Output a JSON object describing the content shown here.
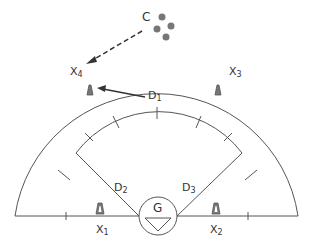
{
  "diagram": {
    "title": "",
    "colors": {
      "line": "#555555",
      "cone": "#777777",
      "ball": "#777777",
      "text": "#333333"
    },
    "labels": {
      "coach": "C",
      "goal": "G",
      "x1": {
        "main": "X",
        "sub": "1"
      },
      "x2": {
        "main": "X",
        "sub": "2"
      },
      "x3": {
        "main": "X",
        "sub": "3"
      },
      "x4": {
        "main": "X",
        "sub": "4"
      },
      "d1": {
        "main": "D",
        "sub": "1"
      },
      "d2": {
        "main": "D",
        "sub": "2"
      },
      "d3": {
        "main": "D",
        "sub": "3"
      }
    },
    "elements": {
      "balls": 4,
      "cones": [
        "X1",
        "X2",
        "X3",
        "X4"
      ],
      "defenders": [
        "D1",
        "D2",
        "D3"
      ],
      "goalkeeper": "G",
      "coach": "C"
    }
  }
}
